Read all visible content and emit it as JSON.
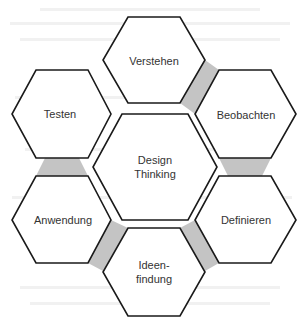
{
  "diagram": {
    "title": "Design Thinking",
    "center": {
      "line1": "Design",
      "line2": "Thinking"
    },
    "steps": [
      {
        "label": "Verstehen"
      },
      {
        "label": "Beobachten"
      },
      {
        "label": "Definieren"
      },
      {
        "label": "Ideen-",
        "label2": "findung"
      },
      {
        "label": "Anwendung"
      },
      {
        "label": "Testen"
      }
    ],
    "colors": {
      "stroke": "#1a1a1a",
      "connector": "#c4c4c4",
      "background": "#ffffff",
      "text": "#333333"
    }
  }
}
